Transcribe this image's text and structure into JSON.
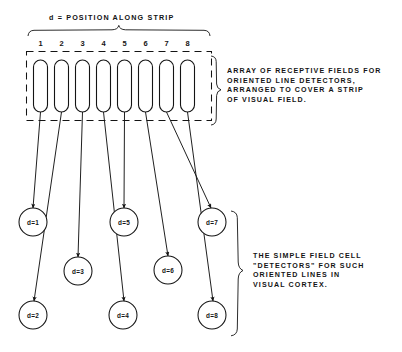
{
  "figure": {
    "title": "d = POSITION ALONG STRIP",
    "strip_positions": [
      "1",
      "2",
      "3",
      "4",
      "5",
      "6",
      "7",
      "8"
    ],
    "receptive_fields": [
      {
        "index": 1,
        "cx": 40.5,
        "top": 60,
        "bottom": 112
      },
      {
        "index": 2,
        "cx": 61.5,
        "top": 60,
        "bottom": 112
      },
      {
        "index": 3,
        "cx": 82.5,
        "top": 60,
        "bottom": 112
      },
      {
        "index": 4,
        "cx": 103.5,
        "top": 60,
        "bottom": 112
      },
      {
        "index": 5,
        "cx": 124.5,
        "top": 60,
        "bottom": 112
      },
      {
        "index": 6,
        "cx": 145.5,
        "top": 60,
        "bottom": 112
      },
      {
        "index": 7,
        "cx": 166.5,
        "top": 60,
        "bottom": 112
      },
      {
        "index": 8,
        "cx": 187.5,
        "top": 60,
        "bottom": 112
      }
    ],
    "detectors": [
      {
        "label": "d=1",
        "cx": 33,
        "cy": 222
      },
      {
        "label": "d=2",
        "cx": 33,
        "cy": 315
      },
      {
        "label": "d=3",
        "cx": 78,
        "cy": 271
      },
      {
        "label": "d=4",
        "cx": 123,
        "cy": 315
      },
      {
        "label": "d=5",
        "cx": 124,
        "cy": 222
      },
      {
        "label": "d=6",
        "cx": 168,
        "cy": 270
      },
      {
        "label": "d=7",
        "cx": 212,
        "cy": 222
      },
      {
        "label": "d=8",
        "cx": 212,
        "cy": 315
      }
    ],
    "captions": {
      "array_note": "ARRAY OF RECEPTIVE FIELDS FOR\nORIENTED LINE DETECTORS,\nARRANGED TO COVER A STRIP\nOF VISUAL FIELD.",
      "detector_note": "THE SIMPLE FIELD CELL\n\"DETECTORS\" FOR SUCH\nORIENTED LINES IN\nVISUAL CORTEX."
    },
    "colors": {
      "ink": "#141414",
      "paper": "#ffffff"
    }
  }
}
